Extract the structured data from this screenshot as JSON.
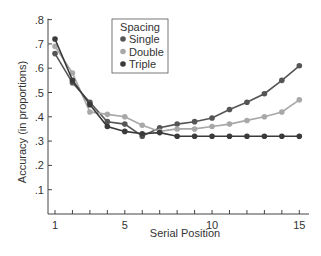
{
  "chart_data": {
    "type": "line",
    "title": "",
    "xlabel": "Serial Position",
    "ylabel": "Accuracy (in proportions)",
    "x": [
      1,
      2,
      3,
      4,
      5,
      6,
      7,
      8,
      9,
      10,
      11,
      12,
      13,
      14,
      15
    ],
    "xticks_labeled": [
      1,
      5,
      10,
      15
    ],
    "yticks": [
      0.1,
      0.2,
      0.3,
      0.4,
      0.5,
      0.6,
      0.7,
      0.8
    ],
    "ytick_labels": [
      ".1",
      ".2",
      ".3",
      ".4",
      ".5",
      ".6",
      ".7",
      ".8"
    ],
    "ylim": [
      0,
      0.8
    ],
    "xlim": [
      1,
      15
    ],
    "grid": false,
    "legend": {
      "title": "Spacing",
      "position": "upper-center"
    },
    "series": [
      {
        "name": "Single",
        "color": "#555555",
        "values": [
          0.66,
          0.54,
          0.46,
          0.38,
          0.37,
          0.32,
          0.355,
          0.37,
          0.38,
          0.395,
          0.43,
          0.46,
          0.495,
          0.55,
          0.61
        ]
      },
      {
        "name": "Double",
        "color": "#a8a8a8",
        "values": [
          0.69,
          0.58,
          0.42,
          0.41,
          0.4,
          0.365,
          0.34,
          0.35,
          0.35,
          0.36,
          0.37,
          0.385,
          0.4,
          0.42,
          0.47
        ]
      },
      {
        "name": "Triple",
        "color": "#3a3a3a",
        "values": [
          0.72,
          0.55,
          0.45,
          0.36,
          0.34,
          0.33,
          0.335,
          0.32,
          0.32,
          0.32,
          0.32,
          0.32,
          0.32,
          0.32,
          0.32
        ]
      }
    ]
  }
}
